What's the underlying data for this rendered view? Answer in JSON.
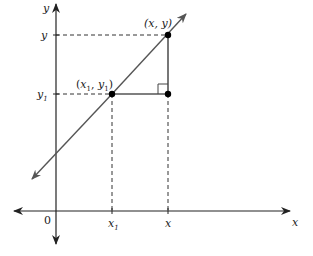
{
  "diagram": {
    "axes": {
      "x_label": "x",
      "y_label": "y",
      "origin_label": "0"
    },
    "points": {
      "p1": {
        "label_open": "(",
        "x_name": "x",
        "x_sub": "1",
        "sep": ", ",
        "y_name": "y",
        "y_sub": "1",
        "label_close": ")"
      },
      "p2": {
        "label": "(x, y)"
      }
    },
    "ticks": {
      "x1": {
        "name": "x",
        "sub": "1"
      },
      "x": {
        "name": "x"
      },
      "y": {
        "name": "y"
      },
      "y1": {
        "name": "y",
        "sub": "1"
      }
    },
    "colors": {
      "axis": "#222222",
      "line": "#555555",
      "dashed": "#333333",
      "point": "#000000"
    }
  }
}
